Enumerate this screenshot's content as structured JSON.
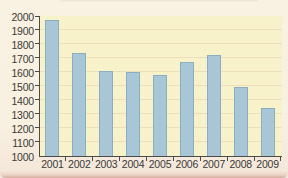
{
  "figure": {
    "kind": "scanned-textbook-bar-chart",
    "title": "",
    "colors": {
      "outer_background": "#f8f0e0",
      "plot_background": "#f8f2cb",
      "bar_fill": "#a9c6d7",
      "bar_border": "#8aafc3",
      "axis": "#4b4b47",
      "text": "#3a3a38",
      "gridline": "rgba(213,177,156,0.32)",
      "page_edge": "#d1ab9d"
    }
  },
  "chart_data": {
    "type": "bar",
    "categories": [
      "2001",
      "2002",
      "2003",
      "2004",
      "2005",
      "2006",
      "2007",
      "2008",
      "2009"
    ],
    "values": [
      1975,
      1735,
      1605,
      1600,
      1580,
      1675,
      1725,
      1490,
      1345
    ],
    "title": "",
    "xlabel": "",
    "ylabel": "",
    "ylim": [
      1000,
      2000
    ],
    "ytick_interval": 100,
    "ytick_labels": [
      "1000",
      "1100",
      "1200",
      "1300",
      "1400",
      "1500",
      "1600",
      "1700",
      "1800",
      "1900",
      "2000"
    ],
    "grid": "faint-horizontal",
    "legend": false,
    "orientation": "vertical",
    "bar_width_px": 14
  }
}
